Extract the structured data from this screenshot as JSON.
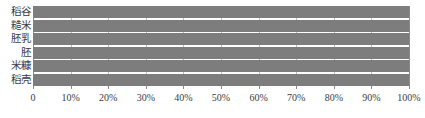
{
  "chart_data": {
    "type": "bar",
    "orientation": "horizontal",
    "stacked": false,
    "title": "",
    "subtitle": "",
    "xlabel": "",
    "ylabel": "",
    "categories": [
      "稻谷",
      "糙米",
      "胚乳",
      "胚",
      "米糠",
      "稻壳"
    ],
    "values": [
      100,
      100,
      100,
      100,
      100,
      100
    ],
    "xlim": [
      0,
      100
    ],
    "xticks": [
      0,
      10,
      20,
      30,
      40,
      50,
      60,
      70,
      80,
      90,
      100
    ],
    "xticklabels": [
      "0",
      "10%",
      "20%",
      "30%",
      "40%",
      "50%",
      "60%",
      "70%",
      "80%",
      "90%",
      "100%"
    ],
    "grid": true,
    "grid_axis": "x",
    "legend": false,
    "legend_position": "none",
    "bar_color": "#7d7d7d",
    "grid_color": "#b9b9b9",
    "axis_color": "#8a8a8a",
    "text_color": "#3b3b3b",
    "annotations": []
  }
}
